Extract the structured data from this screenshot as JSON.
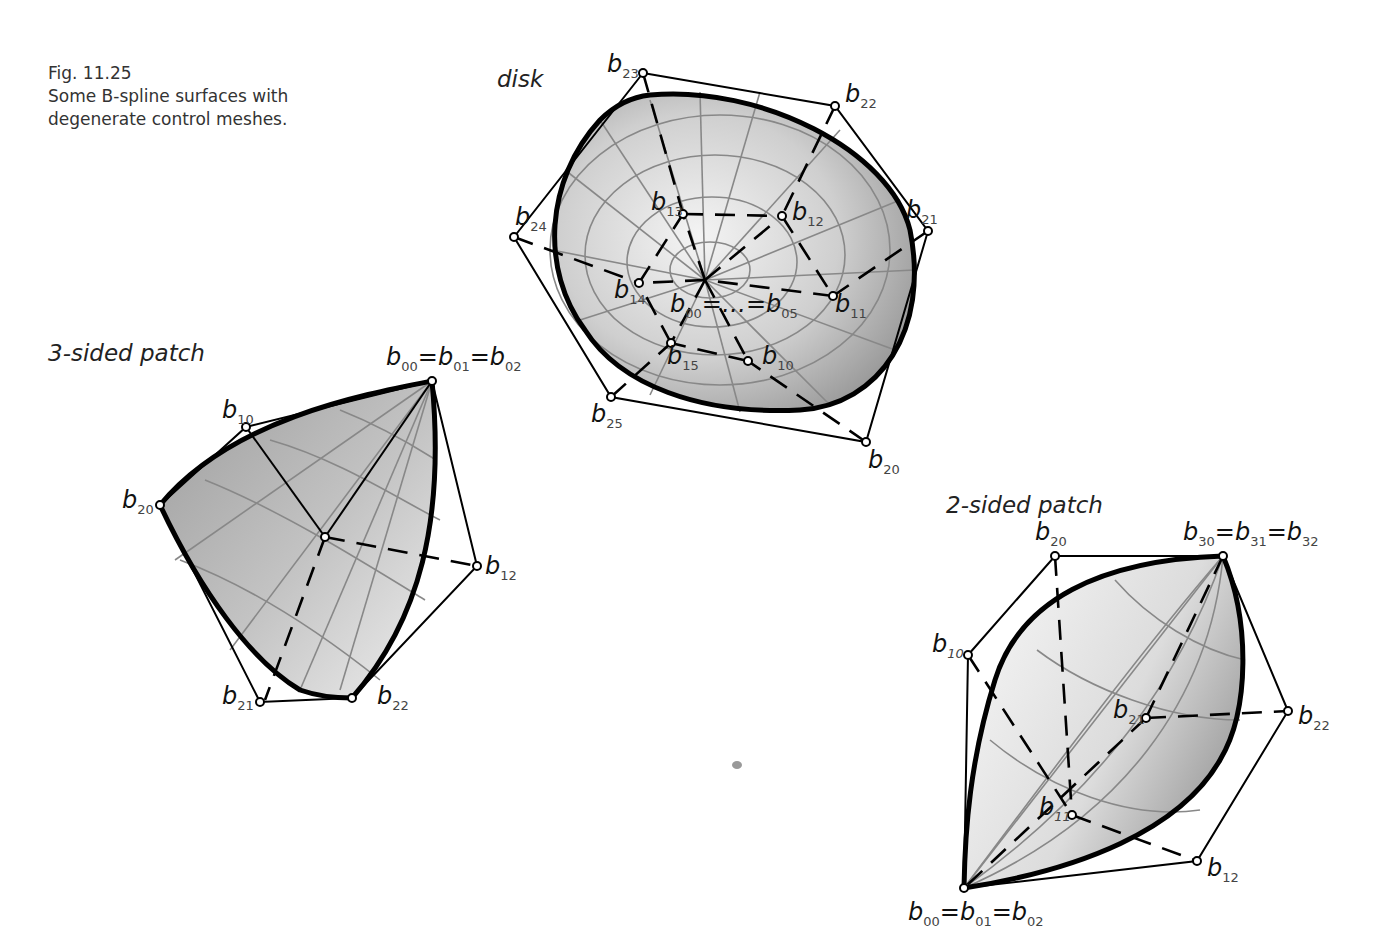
{
  "caption": {
    "figure_number": "Fig. 11.25",
    "line1": "Some B-spline surfaces with",
    "line2": "degenerate control meshes."
  },
  "panels": {
    "disk": {
      "title": "disk",
      "center_label": "b00=…=b05",
      "points": [
        "b10",
        "b11",
        "b12",
        "b13",
        "b14",
        "b15",
        "b20",
        "b21",
        "b22",
        "b23",
        "b24",
        "b25"
      ]
    },
    "three_sided": {
      "title": "3-sided patch",
      "apex_label": "b00=b01=b02",
      "points": [
        "b10",
        "b20",
        "b12",
        "b21",
        "b22"
      ]
    },
    "two_sided": {
      "title": "2-sided patch",
      "top_label": "b30=b31=b32",
      "bottom_label": "b00=b01=b02",
      "points": [
        "b20",
        "b10",
        "b21",
        "b22",
        "b11",
        "b12"
      ]
    }
  },
  "colors": {
    "surface_light": "#f2f2f2",
    "surface_dark": "#9a9a9a",
    "isoline": "#888888",
    "mesh": "#000000"
  }
}
